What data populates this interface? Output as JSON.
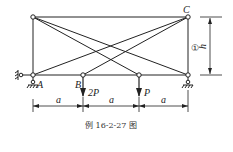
{
  "figure": {
    "caption": "例 16-2-27 图",
    "labels": {
      "A": "A",
      "B": "B",
      "C": "C",
      "load_B": "2P",
      "load_3": "P",
      "height": "h",
      "member_1": "①",
      "span1": "a",
      "span2": "a",
      "span3": "a"
    },
    "colors": {
      "line": "#222222",
      "background": "#ffffff"
    }
  }
}
